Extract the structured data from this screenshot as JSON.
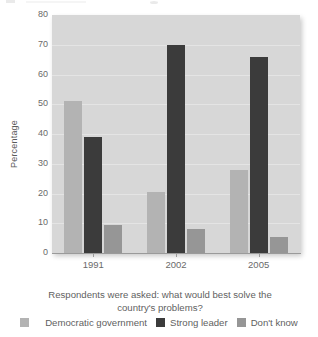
{
  "chart_data": {
    "type": "bar",
    "title": "",
    "caption_line1": "Respondents were asked: what would best solve the",
    "caption_line2": "country's problems?",
    "categories": [
      "1991",
      "2002",
      "2005"
    ],
    "series": [
      {
        "name": "Democratic government",
        "color": "#b3b3b3",
        "values": [
          51,
          20.5,
          28
        ]
      },
      {
        "name": "Strong leader",
        "color": "#3b3b3b",
        "values": [
          39,
          70,
          66
        ]
      },
      {
        "name": "Don't know",
        "color": "#969696",
        "values": [
          9.5,
          8,
          5.5
        ]
      }
    ],
    "xlabel": "",
    "ylabel": "Percentage",
    "ylim": [
      0,
      80
    ],
    "yticks": [
      "0",
      "10",
      "20",
      "30",
      "40",
      "50",
      "60",
      "70",
      "80"
    ],
    "grid": true,
    "legend_position": "bottom",
    "plot_background": "#d7d7d7",
    "gridline_color": "#e4e4e4"
  }
}
